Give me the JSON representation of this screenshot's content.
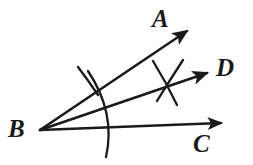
{
  "figure": {
    "stroke_color": "#1a1a1a",
    "background_color": "#ffffff"
  },
  "labels": {
    "A": "A",
    "B": "B",
    "C": "C",
    "D": "D"
  },
  "points": {
    "vertex": {
      "name": "B",
      "x": 40,
      "y": 130
    },
    "ray_a_tip": {
      "name": "A",
      "x": 192,
      "y": 27
    },
    "ray_d_tip": {
      "name": "D",
      "x": 212,
      "y": 71
    },
    "ray_c_tip": {
      "name": "C",
      "x": 226,
      "y": 122
    }
  },
  "geometry": {
    "rays": [
      {
        "id": "ray-BA",
        "from": "B",
        "to": "A",
        "x1": 40,
        "y1": 130,
        "x2": 192,
        "y2": 27
      },
      {
        "id": "ray-BD",
        "from": "B",
        "to": "D",
        "x1": 40,
        "y1": 130,
        "x2": 212,
        "y2": 71
      },
      {
        "id": "ray-BC",
        "from": "B",
        "to": "C",
        "x1": 40,
        "y1": 130,
        "x2": 226,
        "y2": 122
      }
    ],
    "main_arc": {
      "id": "compass-arc",
      "center": "B",
      "start_x": 88,
      "start_y": 72,
      "end_x": 106,
      "end_y": 156,
      "radius": 74
    },
    "tick_mark_on_ray_a": {
      "id": "tick-arc-BA",
      "x1": 78,
      "y1": 68,
      "x2": 97,
      "y2": 94
    },
    "intersection_mark_on_ray_d": {
      "id": "x-arcs-BD",
      "cross_x": 168,
      "cross_y": 82,
      "arc1_x1": 152,
      "arc1_y1": 62,
      "arc1_x2": 178,
      "arc1_y2": 104,
      "arc2_x1": 182,
      "arc2_y1": 60,
      "arc2_x2": 157,
      "arc2_y2": 101
    }
  }
}
